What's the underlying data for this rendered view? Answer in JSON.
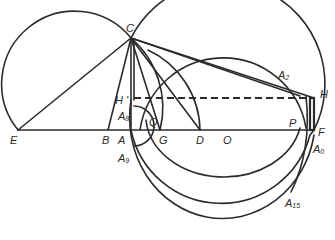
{
  "figure": {
    "stroke_color": "#2b2b2b",
    "background": "#ffffff"
  },
  "points": {
    "C": {
      "label": "C",
      "x": 131,
      "y": 38
    },
    "E": {
      "label": "E",
      "x": 18,
      "y": 130
    },
    "B": {
      "label": "B",
      "x": 108,
      "y": 130
    },
    "A": {
      "label": "A",
      "x": 131,
      "y": 130
    },
    "G": {
      "label": "G",
      "x": 160,
      "y": 130
    },
    "D": {
      "label": "D",
      "x": 200,
      "y": 130
    },
    "O": {
      "label": "O",
      "x": 222,
      "y": 130
    },
    "P": {
      "label": "P",
      "x": 299,
      "y": 130
    },
    "F": {
      "label": "F",
      "x": 314,
      "y": 130
    },
    "H": {
      "label": "H",
      "x": 314,
      "y": 98
    },
    "H_prime": {
      "label": "H'",
      "x": 131,
      "y": 98
    },
    "Q": {
      "label": "Q",
      "x": 146,
      "y": 122
    },
    "A2": {
      "label": "A",
      "sub": "2",
      "x": 293,
      "y": 72
    },
    "A8": {
      "label": "A",
      "sub": "8",
      "x": 131,
      "y": 112
    },
    "A9": {
      "label": "A",
      "sub": "9",
      "x": 133,
      "y": 145
    },
    "A0": {
      "label": "A",
      "sub": "0",
      "x": 314,
      "y": 140
    },
    "A15": {
      "label": "A",
      "sub": "15",
      "x": 290,
      "y": 195
    }
  },
  "labels": {
    "C": "C",
    "E": "E",
    "B": "B",
    "A": "A",
    "G": "G",
    "D": "D",
    "O": "O",
    "P": "P",
    "F": "F",
    "H": "H",
    "H_prime": "H '",
    "Q": "Q",
    "A_letter": "A",
    "sub_2": "2",
    "sub_8": "8",
    "sub_9": "9",
    "sub_0": "0",
    "sub_15": "15"
  }
}
